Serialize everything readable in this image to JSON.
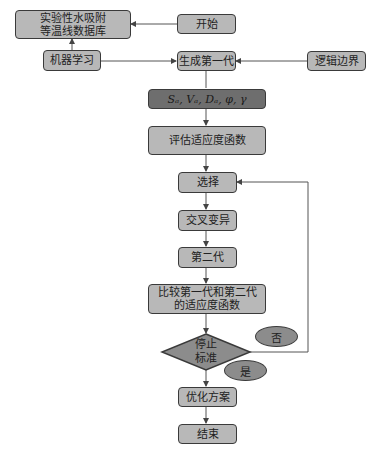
{
  "flowchart": {
    "nodes": {
      "database": "实验性水吸附\n等温线数据库",
      "database_line1": "实验性水吸附",
      "database_line2": "等温线数据库",
      "start": "开始",
      "machine_learning": "机器学习",
      "first_generation": "生成第一代",
      "logic_boundary": "逻辑边界",
      "variables": "Sₐ, Vₐ, Dₐ, φ, γ",
      "evaluate_fitness": "评估适应度函数",
      "selection": "选择",
      "crossover_mutation": "交叉变异",
      "second_generation": "第二代",
      "compare_line1": "比较第一代和第二代",
      "compare_line2": "的适应度函数",
      "stop_line1": "停止",
      "stop_line2": "标准",
      "no": "否",
      "yes": "是",
      "optimize": "优化方案",
      "end": "结束"
    },
    "colors": {
      "box_fill": "#b8b8b8",
      "dark_box_fill": "#6e6e6e",
      "ellipse_fill": "#8c8c8c",
      "diamond_fill": "#8c8c8c",
      "stroke": "#3a3a3a",
      "line": "#555555"
    }
  }
}
